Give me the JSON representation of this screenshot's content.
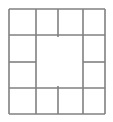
{
  "diagram": {
    "name": "frame-grid",
    "background_color": "#ffffff",
    "line_color": "#808080",
    "cell_fill_color": "#ffffff",
    "line_width": 1.6,
    "canvas": {
      "width": 113,
      "height": 122
    },
    "bounds": {
      "left": 9,
      "top": 9,
      "right": 105,
      "bottom": 114
    },
    "vertical_divider_x": [
      36,
      58,
      83
    ],
    "horizontal_divider_y": [
      35,
      62,
      88
    ],
    "cell_count": 12,
    "center_region": {
      "label": "center-open-region",
      "x": 36,
      "y": 35,
      "width": 47,
      "height": 53,
      "empty": true
    },
    "cells": [
      {
        "label": "top-cell-1",
        "x": 9,
        "y": 9,
        "width": 27,
        "height": 26
      },
      {
        "label": "top-cell-2",
        "x": 36,
        "y": 9,
        "width": 22,
        "height": 26
      },
      {
        "label": "top-cell-3",
        "x": 58,
        "y": 9,
        "width": 25,
        "height": 26
      },
      {
        "label": "top-cell-4",
        "x": 83,
        "y": 9,
        "width": 22,
        "height": 26
      },
      {
        "label": "right-cell-1",
        "x": 83,
        "y": 35,
        "width": 22,
        "height": 27
      },
      {
        "label": "right-cell-2",
        "x": 83,
        "y": 62,
        "width": 22,
        "height": 26
      },
      {
        "label": "bottom-cell-4",
        "x": 83,
        "y": 88,
        "width": 22,
        "height": 26
      },
      {
        "label": "bottom-cell-3",
        "x": 58,
        "y": 88,
        "width": 25,
        "height": 26
      },
      {
        "label": "bottom-cell-2",
        "x": 36,
        "y": 88,
        "width": 22,
        "height": 26
      },
      {
        "label": "bottom-cell-1",
        "x": 9,
        "y": 88,
        "width": 27,
        "height": 26
      },
      {
        "label": "left-cell-2",
        "x": 9,
        "y": 62,
        "width": 27,
        "height": 26
      },
      {
        "label": "left-cell-1",
        "x": 9,
        "y": 35,
        "width": 27,
        "height": 27
      }
    ],
    "segments": [
      {
        "label": "outer-top-edge",
        "x1": 9,
        "y1": 9,
        "x2": 105,
        "y2": 9
      },
      {
        "label": "outer-bottom-edge",
        "x1": 9,
        "y1": 114,
        "x2": 105,
        "y2": 114
      },
      {
        "label": "outer-left-edge",
        "x1": 9,
        "y1": 9,
        "x2": 9,
        "y2": 114
      },
      {
        "label": "outer-right-edge",
        "x1": 105,
        "y1": 9,
        "x2": 105,
        "y2": 114
      },
      {
        "label": "top-divider-1-vertical",
        "x1": 36,
        "y1": 9,
        "x2": 36,
        "y2": 35
      },
      {
        "label": "top-divider-2-vertical",
        "x1": 58,
        "y1": 9,
        "x2": 58,
        "y2": 37
      },
      {
        "label": "top-divider-3-vertical",
        "x1": 83,
        "y1": 9,
        "x2": 83,
        "y2": 35
      },
      {
        "label": "top-row-bottom-left",
        "x1": 9,
        "y1": 35,
        "x2": 58,
        "y2": 35
      },
      {
        "label": "top-row-bottom-right",
        "x1": 58,
        "y1": 35,
        "x2": 105,
        "y2": 35
      },
      {
        "label": "left-divider-middle",
        "x1": 9,
        "y1": 62,
        "x2": 36,
        "y2": 62
      },
      {
        "label": "left-column-inner-edge",
        "x1": 36,
        "y1": 35,
        "x2": 36,
        "y2": 62
      },
      {
        "label": "left-column-inner-lower",
        "x1": 36,
        "y1": 62,
        "x2": 36,
        "y2": 88
      },
      {
        "label": "right-divider-middle",
        "x1": 83,
        "y1": 62,
        "x2": 105,
        "y2": 62
      },
      {
        "label": "right-column-inner-edge",
        "x1": 83,
        "y1": 35,
        "x2": 83,
        "y2": 62
      },
      {
        "label": "right-column-inner-low",
        "x1": 83,
        "y1": 62,
        "x2": 83,
        "y2": 88
      },
      {
        "label": "bottom-row-top-left",
        "x1": 9,
        "y1": 88,
        "x2": 58,
        "y2": 88
      },
      {
        "label": "bottom-row-top-right",
        "x1": 58,
        "y1": 88,
        "x2": 105,
        "y2": 88
      },
      {
        "label": "bottom-divider-1",
        "x1": 36,
        "y1": 88,
        "x2": 36,
        "y2": 114
      },
      {
        "label": "bottom-divider-2",
        "x1": 58,
        "y1": 86,
        "x2": 58,
        "y2": 114
      },
      {
        "label": "bottom-divider-3",
        "x1": 83,
        "y1": 88,
        "x2": 83,
        "y2": 114
      }
    ]
  }
}
